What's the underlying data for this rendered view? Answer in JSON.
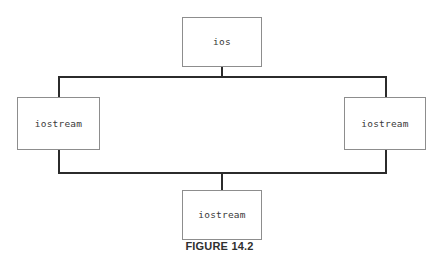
{
  "figure": {
    "caption": "FIGURE 14.2",
    "background_color": "#ffffff",
    "box_border_color": "#8d8d8d",
    "connector_color": "#2b2b2b",
    "label_color": "#3a3a3a"
  },
  "diagram": {
    "type": "class-hierarchy",
    "nodes": [
      {
        "id": "ios",
        "label": "ios",
        "position": "top-center"
      },
      {
        "id": "iostream-left",
        "label": "iostream",
        "position": "middle-left"
      },
      {
        "id": "iostream-right",
        "label": "iostream",
        "position": "middle-right"
      },
      {
        "id": "iostream-bottom",
        "label": "iostream",
        "position": "bottom-center"
      }
    ],
    "edges": [
      {
        "from": "ios",
        "to": "iostream-left"
      },
      {
        "from": "ios",
        "to": "iostream-right"
      },
      {
        "from": "iostream-left",
        "to": "iostream-bottom"
      },
      {
        "from": "iostream-right",
        "to": "iostream-bottom"
      }
    ]
  }
}
